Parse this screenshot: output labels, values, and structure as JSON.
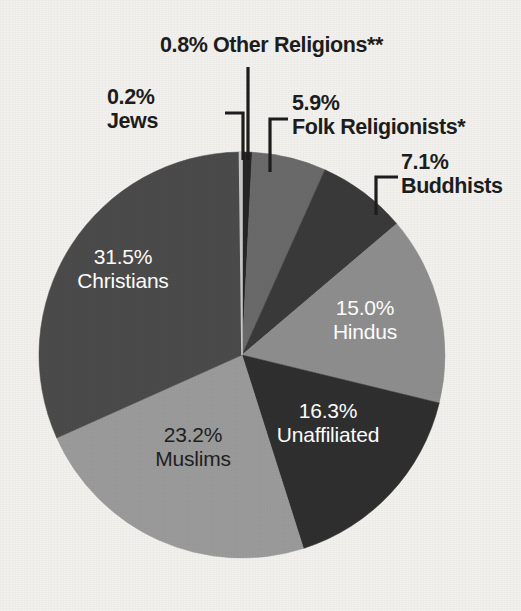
{
  "chart_data": {
    "type": "pie",
    "title": "",
    "subtitle": "",
    "xlabel": "",
    "ylabel": "",
    "legend_position": "none",
    "grid": false,
    "units": "percent",
    "start_angle_deg": 0,
    "direction": "clockwise",
    "categories": [
      "Other Religions**",
      "Folk Religionists*",
      "Buddhists",
      "Hindus",
      "Unaffiliated",
      "Muslims",
      "Christians",
      "Jews"
    ],
    "values": [
      0.8,
      5.9,
      7.1,
      15.0,
      16.3,
      23.2,
      31.5,
      0.2
    ],
    "slices": [
      {
        "name": "Other Religions**",
        "label_value": "0.8%",
        "label_name": "Other Religions**",
        "value": 0.8,
        "color": "#262626",
        "label_placement": "outside",
        "leader": "vertical"
      },
      {
        "name": "Folk Religionists*",
        "label_value": "5.9%",
        "label_name": "Folk Religionists*",
        "value": 5.9,
        "color": "#6a6a6a",
        "label_placement": "outside",
        "leader": "elbow-left"
      },
      {
        "name": "Buddhists",
        "label_value": "7.1%",
        "label_name": "Buddhists",
        "value": 7.1,
        "color": "#3a3a3a",
        "label_placement": "outside",
        "leader": "elbow-left"
      },
      {
        "name": "Hindus",
        "label_value": "15.0%",
        "label_name": "Hindus",
        "value": 15.0,
        "color": "#8e8e8e",
        "label_placement": "inside",
        "leader": "none"
      },
      {
        "name": "Unaffiliated",
        "label_value": "16.3%",
        "label_name": "Unaffiliated",
        "value": 16.3,
        "color": "#2f2f2f",
        "label_placement": "inside",
        "leader": "none"
      },
      {
        "name": "Muslims",
        "label_value": "23.2%",
        "label_name": "Muslims",
        "value": 23.2,
        "color": "#9b9b9b",
        "label_placement": "inside",
        "leader": "none"
      },
      {
        "name": "Christians",
        "label_value": "31.5%",
        "label_name": "Christians",
        "value": 31.5,
        "color": "#4b4b4b",
        "label_placement": "inside",
        "leader": "none"
      },
      {
        "name": "Jews",
        "label_value": "0.2%",
        "label_name": "Jews",
        "value": 0.2,
        "color": "#c9c9c9",
        "label_placement": "outside",
        "leader": "elbow-right"
      }
    ]
  },
  "labels": {
    "other_religions": {
      "pct": "0.8%",
      "name": "Other Religions**",
      "combined": "0.8% Other Religions**"
    },
    "jews": {
      "pct": "0.2%",
      "name": "Jews"
    },
    "folk": {
      "pct": "5.9%",
      "name": "Folk Religionists*"
    },
    "buddhists": {
      "pct": "7.1%",
      "name": "Buddhists"
    },
    "hindus": {
      "pct": "15.0%",
      "name": "Hindus"
    },
    "unaffiliated": {
      "pct": "16.3%",
      "name": "Unaffiliated"
    },
    "muslims": {
      "pct": "23.2%",
      "name": "Muslims"
    },
    "christians": {
      "pct": "31.5%",
      "name": "Christians"
    }
  },
  "colors": {
    "background": "#f3f1ed",
    "label_text_outside": "#1d1d1d",
    "label_text_inside": "#ffffff",
    "leader_line": "#1d1d1d"
  }
}
